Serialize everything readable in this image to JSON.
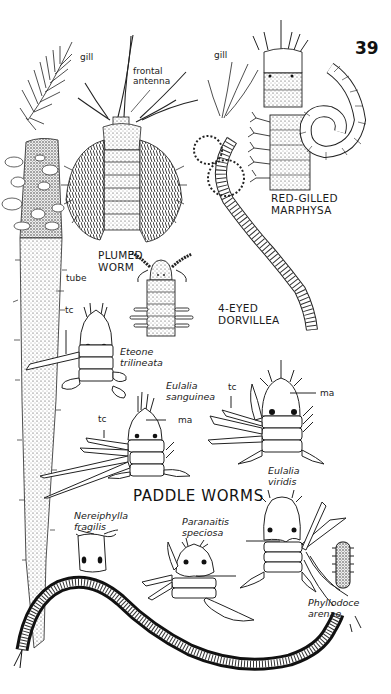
{
  "page": {
    "page_number": "39",
    "section_heading": "PADDLE WORMS"
  },
  "labels": {
    "gill_left": "gill",
    "frontal_antenna": [
      "frontal",
      "antenna"
    ],
    "gill_right": "gill",
    "plumed_worm": [
      "PLUMED",
      "WORM"
    ],
    "tube": "tube",
    "red_gilled_marphysa": [
      "RED-GILLED",
      "MARPHYSA"
    ],
    "four_eyed_dorvillea": [
      "4-EYED",
      "DORVILLEA"
    ],
    "tc_eteone": "tc",
    "eteone_trilineata": [
      "Eteone",
      "trilineata"
    ],
    "eulalia_sanguinea": [
      "Eulalia",
      "sanguinea"
    ],
    "tc_sanguinea": "tc",
    "ma_sanguinea": "ma",
    "tc_viridis": "tc",
    "ma_viridis": "ma",
    "eulalia_viridis": [
      "Eulalia",
      "viridis"
    ],
    "nereiphylla_fragilis": [
      "Nereiphylla",
      "fragilis"
    ],
    "paranaitis_speciosa": [
      "Paranaitis",
      "speciosa"
    ],
    "phyllodoce_arenae": [
      "Phyllodoce",
      "arenae"
    ]
  },
  "figures": [
    {
      "name": "plumed-worm",
      "caption": "PLUMED WORM"
    },
    {
      "name": "red-gilled-marphysa",
      "caption": "RED-GILLED MARPHYSA"
    },
    {
      "name": "four-eyed-dorvillea",
      "caption": "4-EYED DORVILLEA"
    },
    {
      "name": "eteone-trilineata",
      "caption": "Eteone trilineata"
    },
    {
      "name": "eulalia-sanguinea",
      "caption": "Eulalia sanguinea"
    },
    {
      "name": "eulalia-viridis",
      "caption": "Eulalia viridis"
    },
    {
      "name": "nereiphylla-fragilis",
      "caption": "Nereiphylla fragilis"
    },
    {
      "name": "paranaitis-speciosa",
      "caption": "Paranaitis speciosa"
    },
    {
      "name": "phyllodoce-arenae",
      "caption": "Phyllodoce arenae"
    }
  ]
}
